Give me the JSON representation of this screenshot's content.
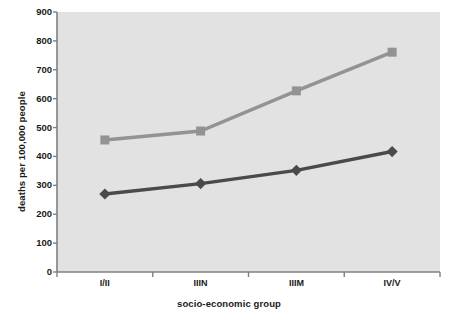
{
  "chart_data": {
    "type": "line",
    "title": "",
    "xlabel": "socio-economic group",
    "ylabel": "deaths per 100,000 people",
    "categories": [
      "I/II",
      "IIIN",
      "IIIM",
      "IV/V"
    ],
    "ylim": [
      0,
      900
    ],
    "yticks": [
      0,
      100,
      200,
      300,
      400,
      500,
      600,
      700,
      800,
      900
    ],
    "ytick_labels": [
      "0",
      "100",
      "200",
      "300",
      "400",
      "500",
      "600",
      "700",
      "800",
      "900"
    ],
    "grid": false,
    "legend": "none",
    "series": [
      {
        "name": "upper-series",
        "color": "#939393",
        "marker": "square",
        "values": [
          457,
          488,
          627,
          761
        ]
      },
      {
        "name": "lower-series",
        "color": "#4a4a4a",
        "marker": "diamond",
        "values": [
          270,
          306,
          352,
          417
        ]
      }
    ]
  },
  "axes": {
    "plot_background": "#e2e2e2",
    "axis_color": "#808080",
    "text_color": "#1a1a1a"
  }
}
